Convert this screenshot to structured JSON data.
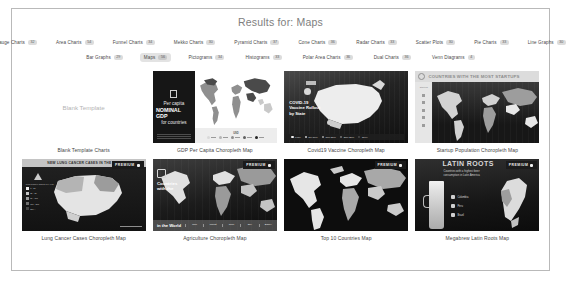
{
  "header": {
    "title": "Results for: Maps"
  },
  "filters": {
    "row1": [
      {
        "label": "Gauge Charts",
        "count": "32"
      },
      {
        "label": "Area Charts",
        "count": "54"
      },
      {
        "label": "Funnel Charts",
        "count": "34"
      },
      {
        "label": "Mekko Charts",
        "count": "30"
      },
      {
        "label": "Pyramid Charts",
        "count": "37"
      },
      {
        "label": "Cone Charts",
        "count": "36"
      },
      {
        "label": "Radar Charts",
        "count": "33"
      },
      {
        "label": "Scatter Plots",
        "count": "30"
      },
      {
        "label": "Pie Charts",
        "count": "33"
      },
      {
        "label": "Line Graphs",
        "count": "30"
      }
    ],
    "row2": [
      {
        "label": "Bar Graphs",
        "count": "29",
        "selected": false
      },
      {
        "label": "Maps",
        "count": "56",
        "selected": true
      },
      {
        "label": "Pictograms",
        "count": "34",
        "selected": false
      },
      {
        "label": "Histograms",
        "count": "33",
        "selected": false
      },
      {
        "label": "Polar Area Charts",
        "count": "36",
        "selected": false
      },
      {
        "label": "Dual Charts",
        "count": "36",
        "selected": false
      },
      {
        "label": "Venn Diagrams",
        "count": "4",
        "selected": false
      }
    ]
  },
  "cards": {
    "blank": {
      "thumb_text": "Blank Template",
      "caption": "Blank Template Charts"
    },
    "gdp": {
      "line1": "Per capita",
      "line2": "NOMINAL GDP",
      "line3": "for countries",
      "legend_title": "USD",
      "legend": [
        "0-1k",
        "1k-5k",
        "5k-20k",
        "20k-50k",
        "50k+"
      ],
      "caption": "GDP Per Capita Choropleth Map"
    },
    "covid": {
      "title": "COVID-19 Vaccine Rollout by State",
      "legend": [
        "0-5%",
        "5%-10%",
        "10%-20%",
        "20%-30%",
        "30%+"
      ],
      "caption": "Covid19 Vaccine Choropleth Map"
    },
    "startup": {
      "banner": "COUNTRIES WITH THE MOST STARTUPS",
      "side_label": "Startups",
      "caption": "Startup Population Choropleth Map"
    },
    "lung": {
      "banner": "NEW LUNG CANCER CASES IN THE U.S.",
      "legend_title": "Lung Cancer Cases per Year",
      "legend": [
        "0 - 2k",
        "2k - 5k",
        "5k - 10k",
        "10k - 20k",
        "20k +"
      ],
      "premium": "PREMIUM",
      "caption": "Lung Cancer Cases Choropleth Map"
    },
    "agriculture": {
      "title": "Countries with the",
      "foot_title": "in the World",
      "foot_items": [
        "Rice",
        "Wheat",
        "Corn",
        "Soy",
        "Barley"
      ],
      "premium": "PREMIUM",
      "caption": "Agriculture Choropleth Map"
    },
    "top10": {
      "premium": "PREMIUM",
      "caption": "Top 10 Countries Map"
    },
    "megabrew": {
      "title": "LATIN ROOTS",
      "subtitle": "Countries with a highest beer consumption in Latin America",
      "items": [
        "Colombia",
        "Peru",
        "Brazil"
      ],
      "premium": "PREMIUM",
      "caption": "Megabrew Latin Roots Map"
    }
  }
}
